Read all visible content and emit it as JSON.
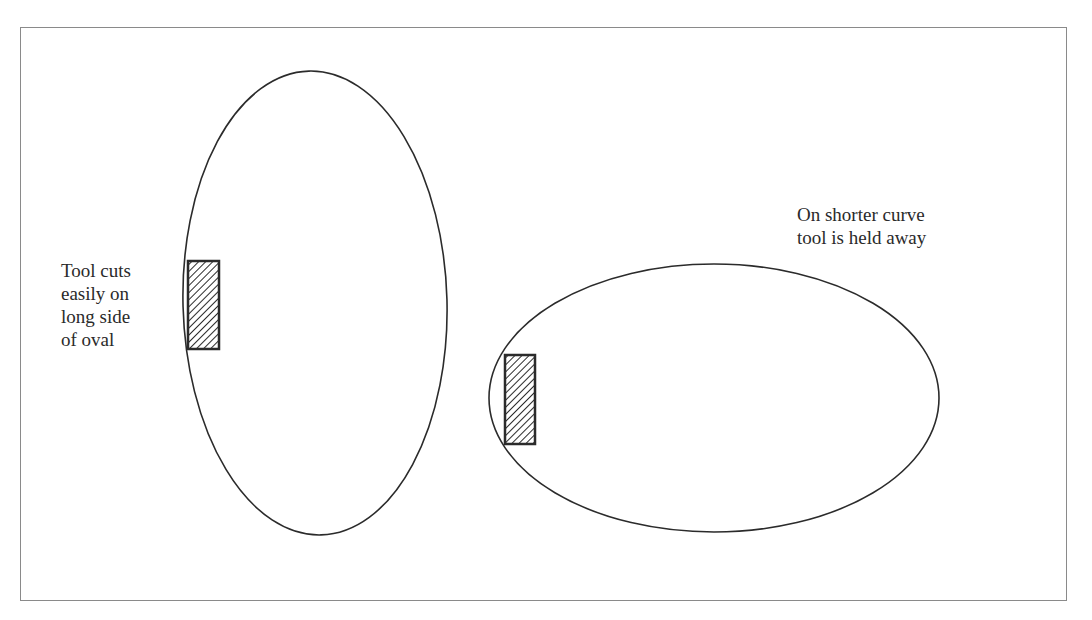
{
  "diagram": {
    "left_oval": {
      "label_lines": [
        "Tool cuts",
        "easily on",
        "long side",
        "of oval"
      ]
    },
    "right_oval": {
      "label_lines": [
        "On shorter curve",
        "tool is held away"
      ]
    },
    "colors": {
      "line": "#2b2b2b",
      "frame": "#8a8a8a",
      "background": "#ffffff"
    }
  }
}
